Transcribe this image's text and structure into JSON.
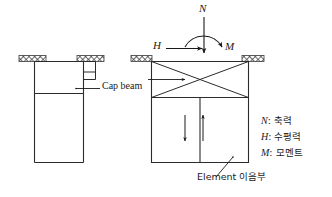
{
  "figure": {
    "title_present": false,
    "background_color": "#ffffff",
    "line_color": "#2b2b2b",
    "hatch_color": "#555555"
  },
  "left_figure": {
    "name": "pier-elevation-plain",
    "callout": {
      "label": "Cap beam",
      "leader_from": [
        75,
        88
      ],
      "leader_to": [
        100,
        88
      ]
    }
  },
  "right_figure": {
    "name": "pier-elevation-modeled",
    "callout": {
      "label": "Element 이음부",
      "leader_from": [
        232,
        160
      ],
      "leader_to": [
        215,
        176
      ]
    },
    "internal_arrows": [
      {
        "name": "down-arrow",
        "direction": "down"
      },
      {
        "name": "up-arrow",
        "direction": "up"
      }
    ],
    "bracing": "x-brace"
  },
  "forces": {
    "axial": {
      "symbol": "N",
      "direction": "down"
    },
    "horizontal": {
      "symbol": "H",
      "direction": "right"
    },
    "moment": {
      "symbol": "M",
      "direction": "clockwise-arc"
    }
  },
  "legend": {
    "items": [
      {
        "symbol": "N",
        "separator": ":",
        "label": "축력"
      },
      {
        "symbol": "H",
        "separator": ":",
        "label": "수평력"
      },
      {
        "symbol": "M",
        "separator": ":",
        "label": "모멘트"
      }
    ]
  }
}
